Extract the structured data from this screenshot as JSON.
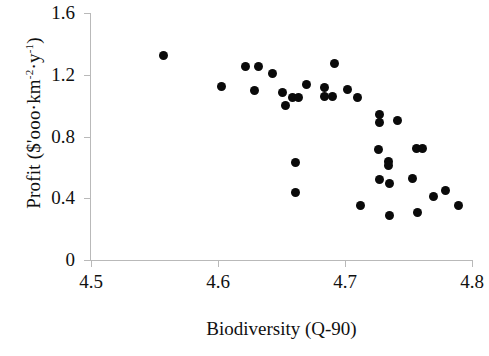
{
  "chart_data": {
    "type": "scatter",
    "title": "",
    "xlabel": "Biodiversity (Q-90)",
    "ylabel_plain": "Profit ($'ooo·km-2·y-1)",
    "ylabel_parts": {
      "prefix": "Profit ($'ooo·km",
      "exp1": "-2",
      "middle": "·y",
      "exp2": "-1",
      "suffix": ")"
    },
    "xlim": [
      4.5,
      4.8
    ],
    "ylim": [
      0,
      1.6
    ],
    "xticks": [
      "4.5",
      "4.6",
      "4.7",
      "4.8"
    ],
    "xtick_values": [
      4.5,
      4.6,
      4.7,
      4.8
    ],
    "yticks": [
      "0",
      "0.4",
      "0.8",
      "1.2",
      "1.6"
    ],
    "ytick_values": [
      0,
      0.4,
      0.8,
      1.2,
      1.6
    ],
    "grid": false,
    "legend": null,
    "marker": {
      "shape": "circle",
      "color": "#0a0a0a",
      "size_px": 9
    },
    "axis_color": "#b9b9b9",
    "n_points": 36,
    "points": [
      {
        "x": 4.557,
        "y": 1.325
      },
      {
        "x": 4.603,
        "y": 1.127
      },
      {
        "x": 4.622,
        "y": 1.252
      },
      {
        "x": 4.632,
        "y": 1.252
      },
      {
        "x": 4.629,
        "y": 1.096
      },
      {
        "x": 4.643,
        "y": 1.208
      },
      {
        "x": 4.651,
        "y": 1.083
      },
      {
        "x": 4.653,
        "y": 1.0
      },
      {
        "x": 4.659,
        "y": 1.05
      },
      {
        "x": 4.661,
        "y": 0.632
      },
      {
        "x": 4.661,
        "y": 0.437
      },
      {
        "x": 4.67,
        "y": 1.137
      },
      {
        "x": 4.684,
        "y": 1.117
      },
      {
        "x": 4.684,
        "y": 1.062
      },
      {
        "x": 4.692,
        "y": 1.275
      },
      {
        "x": 4.702,
        "y": 1.103
      },
      {
        "x": 4.71,
        "y": 1.053
      },
      {
        "x": 4.712,
        "y": 0.35
      },
      {
        "x": 4.727,
        "y": 0.94
      },
      {
        "x": 4.727,
        "y": 0.888
      },
      {
        "x": 4.726,
        "y": 0.718
      },
      {
        "x": 4.727,
        "y": 0.524
      },
      {
        "x": 4.734,
        "y": 0.637
      },
      {
        "x": 4.734,
        "y": 0.612
      },
      {
        "x": 4.735,
        "y": 0.494
      },
      {
        "x": 4.735,
        "y": 0.287
      },
      {
        "x": 4.741,
        "y": 0.905
      },
      {
        "x": 4.753,
        "y": 0.53
      },
      {
        "x": 4.756,
        "y": 0.722
      },
      {
        "x": 4.761,
        "y": 0.722
      },
      {
        "x": 4.757,
        "y": 0.305
      },
      {
        "x": 4.77,
        "y": 0.412
      },
      {
        "x": 4.779,
        "y": 0.452
      },
      {
        "x": 4.789,
        "y": 0.352
      },
      {
        "x": 4.663,
        "y": 1.05
      },
      {
        "x": 4.69,
        "y": 1.062
      }
    ]
  }
}
